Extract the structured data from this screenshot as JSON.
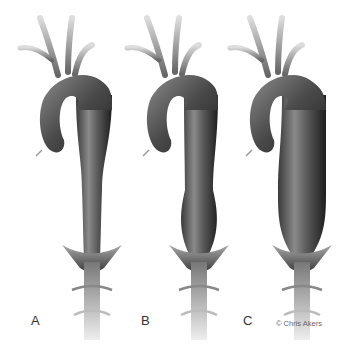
{
  "figure": {
    "panels": [
      {
        "label": "A",
        "description": "normal-aorta"
      },
      {
        "label": "B",
        "description": "descending-aneurysm"
      },
      {
        "label": "C",
        "description": "extensive-thoracoabdominal-aneurysm"
      }
    ],
    "credit": "© Chris Akers",
    "colors": {
      "vessel_dark": "#2a2a2a",
      "vessel_mid": "#6e6e6e",
      "vessel_light": "#b8b8b8",
      "background": "#ffffff"
    }
  }
}
